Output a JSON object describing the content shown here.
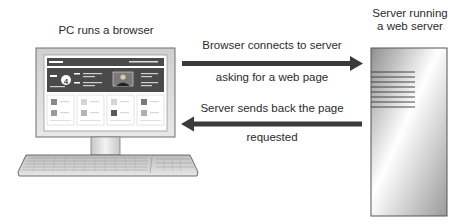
{
  "pc": {
    "label": "PC runs a browser",
    "screen": {
      "badge_number": "4"
    }
  },
  "server": {
    "label_line1": "Server running",
    "label_line2": "a web server"
  },
  "request_arrow": {
    "direction": "right",
    "label_line1": "Browser connects to server",
    "label_line2": "asking for a web page"
  },
  "response_arrow": {
    "direction": "left",
    "label_line1": "Server sends back the page",
    "label_line2": "requested"
  },
  "colors": {
    "arrow": "#3a3a3a",
    "monitor_frame": "#d9d9d9",
    "banner": "#4a4a4a",
    "server_gradient_dark": "#8a8a8a",
    "server_gradient_light": "#ffffff"
  }
}
